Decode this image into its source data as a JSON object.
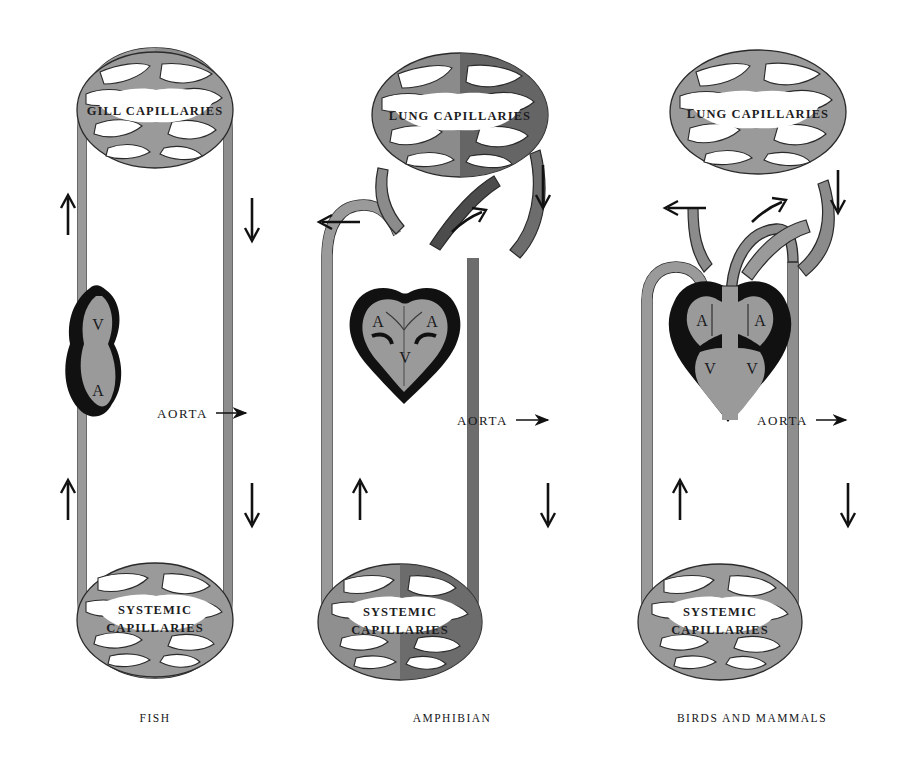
{
  "figure": {
    "background_color": "#ffffff",
    "colors": {
      "oxygenated_vessel": "#9a9a9a",
      "deoxygenated_vessel": "#6d6d6d",
      "heart_wall": "#111111",
      "heart_chamber": "#9a9a9a",
      "outline": "#2a2a2a",
      "text": "#16161a",
      "arrow": "#111111"
    }
  },
  "panels": [
    {
      "id": "fish",
      "caption": "FISH",
      "capillary_beds": [
        {
          "name": "gill-capillaries",
          "label": "GILL CAPILLARIES",
          "position": "top"
        },
        {
          "name": "systemic-capillaries",
          "label_line1": "SYSTEMIC",
          "label_line2": "CAPILLARIES",
          "position": "bottom"
        }
      ],
      "heart": {
        "type": "two-chambered",
        "chambers": [
          {
            "code": "V",
            "name": "ventricle"
          },
          {
            "code": "A",
            "name": "atrium"
          }
        ]
      },
      "aorta_label": "AORTA",
      "flow_arrows": [
        {
          "name": "left-upward-arrow",
          "direction": "up"
        },
        {
          "name": "right-downward-arrow",
          "direction": "down"
        },
        {
          "name": "left-lower-upward-arrow",
          "direction": "up"
        },
        {
          "name": "right-lower-downward-arrow",
          "direction": "down"
        }
      ]
    },
    {
      "id": "amphibian",
      "caption": "AMPHIBIAN",
      "capillary_beds": [
        {
          "name": "lung-capillaries",
          "label": "LUNG CAPILLARIES",
          "position": "top"
        },
        {
          "name": "systemic-capillaries",
          "label_line1": "SYSTEMIC",
          "label_line2": "CAPILLARIES",
          "position": "bottom"
        }
      ],
      "heart": {
        "type": "three-chambered",
        "chambers": [
          {
            "code": "A",
            "name": "left-atrium"
          },
          {
            "code": "A",
            "name": "right-atrium"
          },
          {
            "code": "V",
            "name": "ventricle"
          }
        ]
      },
      "aorta_label": "AORTA",
      "flow_arrows": [
        {
          "name": "pulmonary-left-arrow",
          "direction": "left"
        },
        {
          "name": "pulmonary-right-arrow",
          "direction": "up-right"
        },
        {
          "name": "lung-inflow-down-arrow",
          "direction": "down"
        },
        {
          "name": "left-lower-upward-arrow",
          "direction": "up"
        },
        {
          "name": "right-lower-downward-arrow",
          "direction": "down"
        }
      ]
    },
    {
      "id": "birds-and-mammals",
      "caption": "BIRDS AND MAMMALS",
      "capillary_beds": [
        {
          "name": "lung-capillaries",
          "label": "LUNG CAPILLARIES",
          "position": "top"
        },
        {
          "name": "systemic-capillaries",
          "label_line1": "SYSTEMIC",
          "label_line2": "CAPILLARIES",
          "position": "bottom"
        }
      ],
      "heart": {
        "type": "four-chambered",
        "chambers": [
          {
            "code": "A",
            "name": "left-atrium"
          },
          {
            "code": "A",
            "name": "right-atrium"
          },
          {
            "code": "V",
            "name": "left-ventricle"
          },
          {
            "code": "V",
            "name": "right-ventricle"
          }
        ]
      },
      "aorta_label": "AORTA",
      "flow_arrows": [
        {
          "name": "pulmonary-left-arrow",
          "direction": "left"
        },
        {
          "name": "pulmonary-right-arrow",
          "direction": "up-right"
        },
        {
          "name": "lung-inflow-down-arrow",
          "direction": "down"
        },
        {
          "name": "left-lower-upward-arrow",
          "direction": "up"
        },
        {
          "name": "right-lower-downward-arrow",
          "direction": "down"
        }
      ]
    }
  ]
}
